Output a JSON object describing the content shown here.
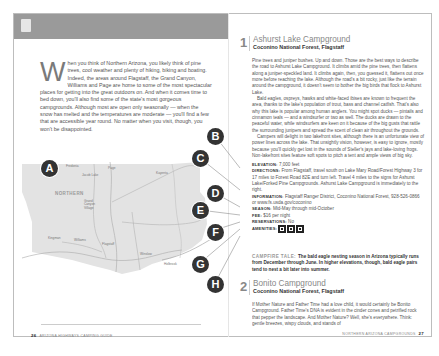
{
  "left_page": {
    "page_number": "26",
    "running_footer": "ARIZONA HIGHWAYS CAMPING GUIDE",
    "intro": {
      "dropcap": "W",
      "text": "hen you think of Northern Arizona, you likely think of pine trees, cool weather and plenty of hiking, biking and boating. Indeed, the areas around Flagstaff, the Grand Canyon, Williams and Page are home to some of the most spectacular places for getting into the great outdoors on. And when it comes time to bed down, you'll also find some of the state's most gorgeous campgrounds. Although most are open only seasonally — when the snow has melted and the temperatures are moderate — you'll find a few that are accessible year round. No matter when you visit, though, you won't be disappointed."
    },
    "map": {
      "region_label": "NORTHERN",
      "place_labels": [
        "Fredonia",
        "Jacob Lake",
        "Page",
        "Kayenta",
        "Grand Canyon Village",
        "Williams",
        "Flagstaff",
        "Kingman",
        "Winslow",
        "Holbrook"
      ],
      "markers": [
        "A",
        "B",
        "C",
        "D",
        "E",
        "F",
        "G",
        "H"
      ]
    }
  },
  "right_page": {
    "page_number": "27",
    "running_footer": "NORTHERN ARIZONA CAMPGROUNDS",
    "entries": [
      {
        "number": "1",
        "title": "Ashurst Lake Campground",
        "subtitle": "Coconino National Forest, Flagstaff",
        "paragraphs": [
          "Pine trees and juniper bushes. Up and down. Those are the best ways to describe the road to Ashurst Lake Campground. It climbs amid the pine trees, then flattens along a juniper-speckled land. It climbs again, then, you guessed it, flattens out once more before reaching the lake. Although the road's a bit rocky, just like the terrain around the campground, it doesn't seem to bother the big birds that flock to Ashurst Lake.",
          "Bald eagles, ospreys, hawks and white-faced ibises are known to frequent the area, thanks to the lake's population of trout, bass and channel catfish. That's also why this lake is popular among human anglers. You might spot ducks — pintails and cinnamon teals — and a windsurfer or two as well. The ducks are drawn to the peaceful water, while windsurfers are keen on it because of the big gusts that rattle the surrounding junipers and spread the scent of clean air throughout the grounds.",
          "Campers will delight in two lakefront sites, although there is an unfortunate view of power lines across the lake. That unsightly vision, however, is easy to ignore, mostly because you'll quickly get lost in the sounds of Steller's jays and lake-loving frogs. Non-lakefront sites feature soft spots to pitch a tent and ample views of big sky."
        ],
        "facts": [
          {
            "key": "ELEVATION:",
            "value": "7,000 feet"
          },
          {
            "key": "DIRECTIONS:",
            "value": "From Flagstaff, travel south on Lake Mary Road/Forest Highway 3 for 17 miles to Forest Road 82E and turn left. Travel 4 miles to the signs for Ashurst Lake/Forked Pine Campgrounds. Ashurst Lake Campground is immediately to the right."
          },
          {
            "key": "INFORMATION:",
            "value": "Flagstaff Ranger District, Coconino National Forest, 928-526-0866 or www.fs.usda.gov/coconino"
          },
          {
            "key": "SEASON:",
            "value": "Mid-May through mid-October"
          },
          {
            "key": "FEE:",
            "value": "$16 per night"
          },
          {
            "key": "RESERVATIONS:",
            "value": "No"
          },
          {
            "key": "AMENITIES:",
            "value": ""
          }
        ],
        "amenity_icons": [
          "restroom-icon",
          "picnic-table-icon",
          "drinking-water-icon"
        ],
        "campfire_tale": {
          "lead": "CAMPFIRE TALE:",
          "text": "The bald eagle nesting season in Arizona typically runs from December through June. In higher elevations, though, bald eagle pairs tend to nest a bit later into summer."
        }
      },
      {
        "number": "2",
        "title": "Bonito Campground",
        "subtitle": "Coconino National Forest, Flagstaff",
        "paragraphs": [
          "If Mother Nature and Father Time had a love child, it would certainly be Bonito Campground. Father Time's DNA is evident in the cinder cones and petrified rock that pepper the landscape. And Mother Nature? Well, she's everywhere. Think: gentle breezes, wispy clouds, and stands of"
        ]
      }
    ]
  },
  "colors": {
    "header_band": "#9a9a9a",
    "marker_fill": "#333333",
    "map_land": "#e3e3e3",
    "title_gray": "#888888"
  }
}
